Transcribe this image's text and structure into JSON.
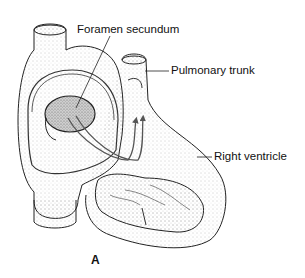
{
  "figure": {
    "panel_letter": "A",
    "labels": [
      {
        "id": "foramen-secundum",
        "text": "Foramen secundum"
      },
      {
        "id": "pulmonary-trunk",
        "text": "Pulmonary trunk"
      },
      {
        "id": "right-ventricle",
        "text": "Right ventricle"
      }
    ]
  },
  "colors": {
    "ink": "#111111",
    "stipple": "#9a9a9a",
    "background": "#ffffff"
  }
}
